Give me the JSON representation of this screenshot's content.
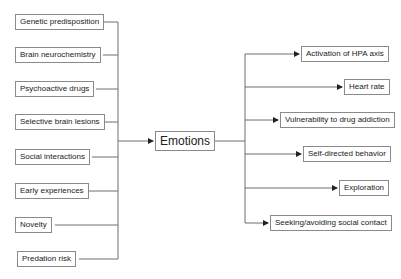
{
  "diagram": {
    "center": {
      "label": "Emotions"
    },
    "inputs": [
      {
        "label": "Genetic predisposition"
      },
      {
        "label": "Brain neurochemistry"
      },
      {
        "label": "Psychoactive drugs"
      },
      {
        "label": "Selective brain lesions"
      },
      {
        "label": "Social interactions"
      },
      {
        "label": "Early experiences"
      },
      {
        "label": "Novelty"
      },
      {
        "label": "Predation risk"
      }
    ],
    "outputs": [
      {
        "label": "Activation of HPA axis"
      },
      {
        "label": "Heart rate"
      },
      {
        "label": "Vulnerability to drug addiction"
      },
      {
        "label": "Self-directed behavior"
      },
      {
        "label": "Exploration"
      },
      {
        "label": "Seeking/avoiding social contact"
      }
    ],
    "colors": {
      "line": "#6e6e6e",
      "border": "#8a8a8a",
      "text": "#222222"
    }
  }
}
